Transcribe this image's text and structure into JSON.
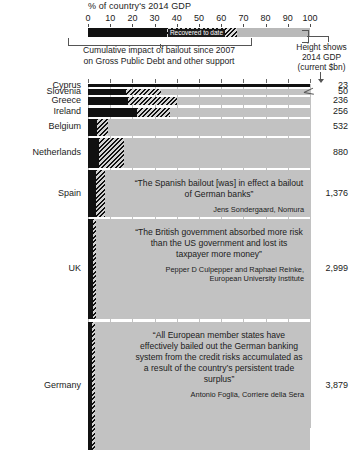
{
  "key": {
    "title": "% of country's 2014 GDP",
    "axis_ticks": [
      "0",
      "10",
      "20",
      "30",
      "40",
      "50",
      "60",
      "70",
      "80",
      "90",
      "100"
    ],
    "recovered_label": "Recovered to date",
    "caption_line1": "Cumulative impact of bailout since 2007",
    "caption_line2": "on Gross Public Debt and other support",
    "height_note_line1": "Height shows",
    "height_note_line2": "2014 GDP",
    "height_note_line3": "(current $bn)"
  },
  "chart_data": {
    "type": "bar",
    "title": "% of country's 2014 GDP",
    "xlabel": "% of country's 2014 GDP",
    "ylabel": "",
    "xlim": [
      0,
      100
    ],
    "grid": true,
    "legend_position": "top",
    "series": [
      {
        "name": "Cumulative impact of bailout since 2007 on Gross Public Debt and other support",
        "style": "solid-dark"
      },
      {
        "name": "Recovered to date",
        "style": "hatched"
      }
    ],
    "note": "Bar height (thickness) is proportional to 2014 GDP in current $bn",
    "categories": [
      {
        "label": "Cyprus",
        "gdp_bn": "23",
        "gdp_value": 23,
        "impact_pct": 110,
        "recovered_pct": 0,
        "row_height_px": 3.0,
        "quote": null
      },
      {
        "label": "Slovenia",
        "gdp_bn": "50",
        "gdp_value": 50,
        "impact_pct": 17,
        "recovered_pct": 16,
        "row_height_px": 6.0,
        "quote": null
      },
      {
        "label": "Greece",
        "gdp_bn": "236",
        "gdp_value": 236,
        "impact_pct": 18,
        "recovered_pct": 22,
        "row_height_px": 8.0,
        "quote": null
      },
      {
        "label": "Ireland",
        "gdp_bn": "256",
        "gdp_value": 256,
        "impact_pct": 22,
        "recovered_pct": 15,
        "row_height_px": 9.0,
        "quote": null
      },
      {
        "label": "Belgium",
        "gdp_bn": "532",
        "gdp_value": 532,
        "impact_pct": 4,
        "recovered_pct": 5,
        "row_height_px": 17.0,
        "quote": null
      },
      {
        "label": "Netherlands",
        "gdp_bn": "880",
        "gdp_value": 880,
        "impact_pct": 5,
        "recovered_pct": 11,
        "row_height_px": 30.0,
        "quote": null
      },
      {
        "label": "Spain",
        "gdp_bn": "1,376",
        "gdp_value": 1376,
        "impact_pct": 3.5,
        "recovered_pct": 4,
        "row_height_px": 47.0,
        "quote": {
          "text": "“The Spanish bailout [was] in effect a bailout of German banks”",
          "source": "Jens Sondergaard, Nomura"
        }
      },
      {
        "label": "UK",
        "gdp_bn": "2,999",
        "gdp_value": 2999,
        "impact_pct": 2.2,
        "recovered_pct": 1.5,
        "row_height_px": 100.0,
        "quote": {
          "text": "“The British government absorbed more risk than the US government and lost its taxpayer more money”",
          "source": "Pepper D Culpepper and Raphael Reinke, European University Institute"
        }
      },
      {
        "label": "Germany",
        "gdp_bn": "3,879",
        "gdp_value": 3879,
        "impact_pct": 2.0,
        "recovered_pct": 1.2,
        "row_height_px": 128.0,
        "quote": {
          "text": "“All European member states have effectively bailed out the German banking system from the credit risks accumulated as a result of the country’s persistent trade surplus”",
          "source": "Antonio Foglia, Corriere della Sera"
        }
      }
    ]
  }
}
